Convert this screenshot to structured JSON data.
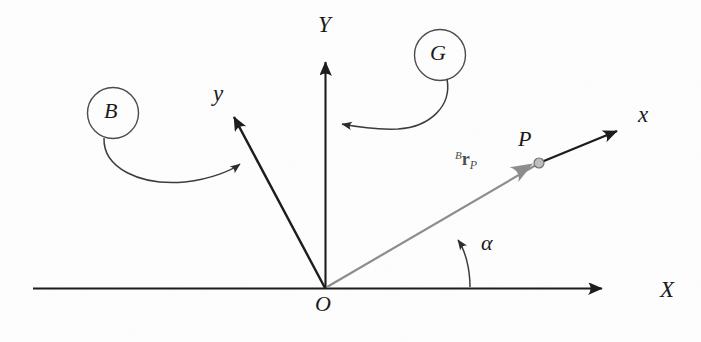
{
  "figure": {
    "background_color": "#fdfdfd",
    "ink_color": "#1a1a1a",
    "vector_color": "#808080",
    "leader_color": "#555555"
  },
  "axes": {
    "global": [
      {
        "id": "X",
        "label": "X",
        "label_x": 660,
        "label_y": 278,
        "from": [
          33,
          288
        ],
        "to": [
          610,
          288
        ],
        "color": "#1a1a1a"
      },
      {
        "id": "Y",
        "label": "Y",
        "label_x": 318,
        "label_y": 13,
        "from": [
          325,
          288
        ],
        "to": [
          325,
          52
        ],
        "color": "#1a1a1a"
      }
    ],
    "body": [
      {
        "id": "y",
        "label": "y",
        "label_x": 213,
        "label_y": 82,
        "from": [
          325,
          288
        ],
        "to": [
          230,
          110
        ],
        "color": "#1a1a1a"
      },
      {
        "id": "x",
        "label": "x",
        "label_x": 638,
        "label_y": 103,
        "from": [
          325,
          288
        ],
        "to": [
          625,
          126
        ],
        "color": "#1a1a1a"
      }
    ]
  },
  "frames": [
    {
      "id": "B",
      "label": "B",
      "circle_cx": 113,
      "circle_cy": 113,
      "circle_r": 25,
      "label_x": 104,
      "label_y": 100,
      "points_to": "body-y-axis"
    },
    {
      "id": "G",
      "label": "G",
      "circle_cx": 440,
      "circle_cy": 55,
      "circle_r": 25,
      "label_x": 430,
      "label_y": 42,
      "points_to": "global-Y-axis"
    }
  ],
  "origin": {
    "label": "O",
    "x": 325,
    "y": 288,
    "label_x": 315,
    "label_y": 293
  },
  "point": {
    "label": "P",
    "x": 539,
    "y": 163,
    "radius": 5,
    "label_x": 518,
    "label_y": 128,
    "fill": "#b5b5b5"
  },
  "vector": {
    "id": "B-r-P",
    "superscript": "B",
    "symbol": "r",
    "subscript": "P",
    "label_x": 455,
    "label_y": 150,
    "from": [
      327,
      287
    ],
    "to": [
      534,
      166
    ],
    "color": "#808080"
  },
  "angle": {
    "label": "α",
    "symbol_name": "alpha",
    "label_x": 481,
    "label_y": 232,
    "arc_from": [
      470,
      288
    ],
    "arc_to": [
      456,
      236
    ],
    "color": "#555555"
  }
}
